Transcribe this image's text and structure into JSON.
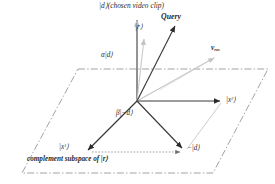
{
  "figure": {
    "background_color": "#ffffff",
    "ink_color": "#2b2b2b",
    "faint_color": "#b9b9b9",
    "plane_color": "#8a8a8a"
  },
  "labels": {
    "d_chosen": "|d⟩(chosen video clip)",
    "query": "Query",
    "r": "|r⟩",
    "alpha_d": "α|d⟩",
    "v_res": "v",
    "v_res_sub": "res",
    "x2_base": "|x",
    "x2_sup": "2",
    "x2_tail": "⟩",
    "beta_neg_d": "β|−d⟩",
    "x1_base": "|x",
    "x1_sup": "1",
    "x1_tail": "⟩",
    "neg_d": "−|d⟩",
    "complement": "complement subspace of |r⟩"
  },
  "geometry": {
    "origin": {
      "x": 137,
      "y": 101
    },
    "plane_corners": [
      {
        "x": 78,
        "y": 69
      },
      {
        "x": 268,
        "y": 69
      },
      {
        "x": 213,
        "y": 173
      },
      {
        "x": 22,
        "y": 173
      }
    ],
    "vectors": [
      {
        "name": "d-axis",
        "from": {
          "x": 137,
          "y": 101
        },
        "to": {
          "x": 137,
          "y": 18
        },
        "style": "solid",
        "arrow": true
      },
      {
        "name": "r-vector",
        "from": {
          "x": 137,
          "y": 101
        },
        "to": {
          "x": 145,
          "y": 38
        },
        "style": "faint",
        "arrow": true
      },
      {
        "name": "query",
        "from": {
          "x": 137,
          "y": 101
        },
        "to": {
          "x": 176,
          "y": 25
        },
        "style": "solid",
        "arrow": true
      },
      {
        "name": "v-res",
        "from": {
          "x": 137,
          "y": 101
        },
        "to": {
          "x": 215,
          "y": 57
        },
        "style": "faint",
        "arrow": true
      },
      {
        "name": "x2-vector",
        "from": {
          "x": 137,
          "y": 101
        },
        "to": {
          "x": 222,
          "y": 101
        },
        "style": "solid",
        "arrow": true
      },
      {
        "name": "x1-vector",
        "from": {
          "x": 137,
          "y": 101
        },
        "to": {
          "x": 86,
          "y": 152
        },
        "style": "solid",
        "arrow": true
      },
      {
        "name": "neg-d",
        "from": {
          "x": 137,
          "y": 101
        },
        "to": {
          "x": 184,
          "y": 150
        },
        "style": "solid",
        "arrow": true
      },
      {
        "name": "x1-to-negd",
        "from": {
          "x": 89,
          "y": 152
        },
        "to": {
          "x": 182,
          "y": 152
        },
        "style": "dotted",
        "arrow": true
      },
      {
        "name": "negd-to-x2",
        "from": {
          "x": 186,
          "y": 150
        },
        "to": {
          "x": 222,
          "y": 103
        },
        "style": "faint",
        "arrow": false
      }
    ]
  }
}
